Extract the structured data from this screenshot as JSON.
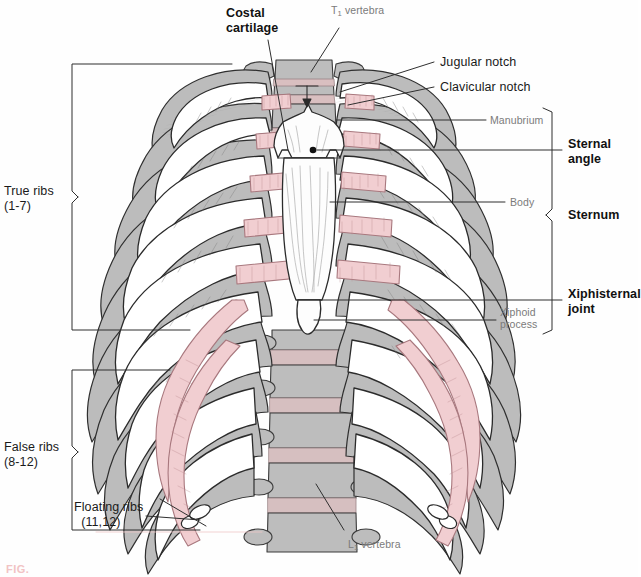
{
  "figure": {
    "background_color": "#ffffff",
    "caption_text": "FIG."
  },
  "colors": {
    "bone_gray": "#b9b9b9",
    "bone_white": "#ffffff",
    "cartilage_pink": "#f0cdd0",
    "disc_pink": "#decbcb",
    "outline": "#2b2b2b",
    "leader_line": "#333333",
    "label_major": "#111111",
    "label_sub": "#7b7b7b",
    "caption_red": "#f0b9ba"
  },
  "labels": {
    "costal_cartilage": "Costal\ncartilage",
    "t1_vertebra_prefix": "T",
    "t1_vertebra_sub": "1",
    "t1_vertebra_suffix": " vertebra",
    "jugular_notch": "Jugular notch",
    "clavicular_notch": "Clavicular notch",
    "manubrium": "Manubrium",
    "sternal_angle": "Sternal\nangle",
    "body": "Body",
    "sternum": "Sternum",
    "xiphisternal_joint": "Xiphisternal\njoint",
    "xiphoid_process": "Xiphoid\nprocess",
    "true_ribs": "True ribs\n(1-7)",
    "false_ribs": "False ribs\n(8-12)",
    "floating_ribs": "Floating ribs\n  (11,12)",
    "l1_vertebra_prefix": "L",
    "l1_vertebra_sub": "1",
    "l1_vertebra_suffix": " vertebra"
  },
  "brackets": {
    "true_ribs": {
      "x": 68,
      "top": 62,
      "bottom": 332,
      "tip_y": 197
    },
    "false_ribs": {
      "x": 68,
      "top": 368,
      "bottom": 530,
      "tip_y": 452
    },
    "sternum": {
      "x": 551,
      "top": 110,
      "bottom": 330,
      "tip_y": 215
    }
  }
}
